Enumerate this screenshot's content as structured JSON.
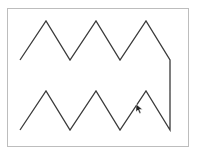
{
  "canvas": {
    "border_color": "#bdbdbd",
    "stroke_color": "#3a3a3a",
    "stroke_width": 1.3,
    "polyline": {
      "points": [
        [
          20,
          60
        ],
        [
          46,
          21
        ],
        [
          70,
          60
        ],
        [
          96,
          21
        ],
        [
          120,
          60
        ],
        [
          146,
          21
        ],
        [
          170,
          60
        ],
        [
          170,
          130
        ],
        [
          146,
          91
        ],
        [
          120,
          130
        ],
        [
          96,
          91
        ],
        [
          70,
          130
        ],
        [
          46,
          91
        ],
        [
          20,
          130
        ]
      ]
    }
  },
  "cursor": {
    "type": "arrow-pointer",
    "x": 137,
    "y": 105
  }
}
